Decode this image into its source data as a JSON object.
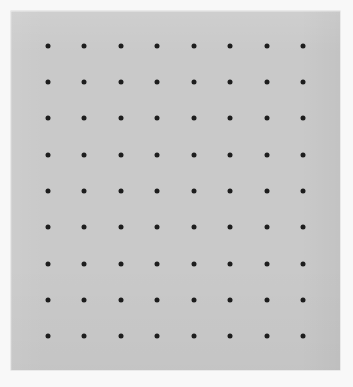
{
  "scene": {
    "title": "Dot grid sheet",
    "background_color": "#f8f8f8",
    "width": 353,
    "height": 387
  },
  "paper": {
    "label": "gray paper sheet",
    "color": "#c9c9c9",
    "x": 11,
    "y": 11,
    "width": 329,
    "height": 359
  },
  "dot_grid": {
    "label": "dot matrix",
    "rows": 9,
    "columns": 8,
    "total_dots": 72,
    "dot_color": "#1d1d1d",
    "dot_diameter": 5,
    "origin_x": 48,
    "origin_y": 46,
    "spacing_x": 36.4,
    "spacing_y": 36.25,
    "row_y": [
      46,
      82,
      118,
      155,
      191,
      227,
      264,
      300,
      336
    ],
    "column_x": [
      48,
      84,
      121,
      157,
      194,
      230,
      267,
      303
    ]
  }
}
